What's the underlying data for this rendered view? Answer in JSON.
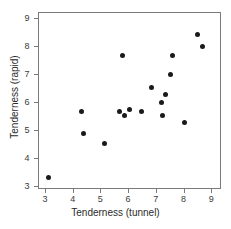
{
  "chart_data": {
    "type": "scatter",
    "title": "",
    "xlabel": "Tenderness (tunnel)",
    "ylabel": "Tenderness (rapid)",
    "xlim": [
      2.75,
      9.35
    ],
    "ylim": [
      2.9,
      9.2
    ],
    "xticks": [
      3,
      4,
      5,
      6,
      7,
      8,
      9
    ],
    "xticklabels": [
      "3",
      "4",
      "5",
      "6",
      "7",
      "8",
      "9"
    ],
    "yticks": [
      3,
      4,
      5,
      6,
      7,
      8,
      9
    ],
    "yticklabels": [
      "3",
      "4",
      "5",
      "6",
      "7",
      "8",
      "9"
    ],
    "grid": false,
    "legend": null,
    "marker": "filled-circle",
    "marker_color": "#1a1a1a",
    "frame_color": "#7a7a7a",
    "points": [
      {
        "x": 3.1,
        "y": 3.35
      },
      {
        "x": 4.3,
        "y": 5.7
      },
      {
        "x": 4.35,
        "y": 4.9
      },
      {
        "x": 5.1,
        "y": 4.55
      },
      {
        "x": 5.65,
        "y": 5.7
      },
      {
        "x": 5.75,
        "y": 7.67
      },
      {
        "x": 5.85,
        "y": 5.55
      },
      {
        "x": 6.0,
        "y": 5.78
      },
      {
        "x": 6.45,
        "y": 5.68
      },
      {
        "x": 6.8,
        "y": 6.55
      },
      {
        "x": 7.15,
        "y": 6.0
      },
      {
        "x": 7.2,
        "y": 5.55
      },
      {
        "x": 7.3,
        "y": 6.3
      },
      {
        "x": 7.5,
        "y": 7.0
      },
      {
        "x": 7.55,
        "y": 7.67
      },
      {
        "x": 8.0,
        "y": 5.3
      },
      {
        "x": 8.45,
        "y": 8.43
      },
      {
        "x": 8.65,
        "y": 8.0
      }
    ]
  }
}
